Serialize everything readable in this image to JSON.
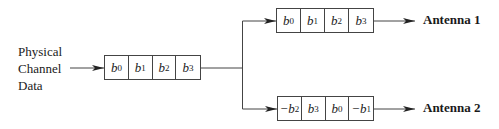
{
  "diagram": {
    "type": "signal-flow",
    "input": {
      "label_lines": [
        "Physical",
        "Channel",
        "Data"
      ]
    },
    "source_register": {
      "cells": [
        {
          "sign": "",
          "symbol": "b",
          "index": "0"
        },
        {
          "sign": "",
          "symbol": "b",
          "index": "1"
        },
        {
          "sign": "",
          "symbol": "b",
          "index": "2"
        },
        {
          "sign": "",
          "symbol": "b",
          "index": "3"
        }
      ]
    },
    "branches": [
      {
        "register": {
          "cells": [
            {
              "sign": "",
              "symbol": "b",
              "index": "0"
            },
            {
              "sign": "",
              "symbol": "b",
              "index": "1"
            },
            {
              "sign": "",
              "symbol": "b",
              "index": "2"
            },
            {
              "sign": "",
              "symbol": "b",
              "index": "3"
            }
          ]
        },
        "output_label": "Antenna 1"
      },
      {
        "register": {
          "cells": [
            {
              "sign": "−",
              "symbol": "b",
              "index": "2"
            },
            {
              "sign": "",
              "symbol": "b",
              "index": "3"
            },
            {
              "sign": "",
              "symbol": "b",
              "index": "0"
            },
            {
              "sign": "−",
              "symbol": "b",
              "index": "1"
            }
          ]
        },
        "output_label": "Antenna 2"
      }
    ],
    "colors": {
      "line": "#444444",
      "text": "#1a1a1a",
      "background": "#ffffff"
    }
  }
}
